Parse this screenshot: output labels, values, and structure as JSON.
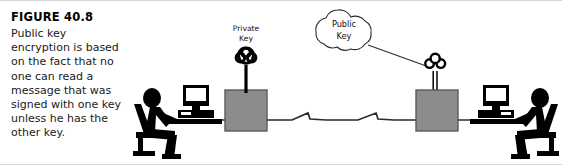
{
  "figure": {
    "title": "FIGURE 40.8",
    "caption": "Public key encryption is based on the fact that no one can read a message that was signed with one key unless he has the other key.",
    "caption_lines": [
      "Public key encryption is",
      "based on the fact that",
      "no one can read a",
      "message that was",
      "signed with one key",
      "unless he has the other",
      "key."
    ]
  },
  "diagram": {
    "type": "public-key-encryption-network-diagram",
    "labels": {
      "private_key_line1": "Private",
      "private_key_line2": "Key",
      "public_key_line1": "Public",
      "public_key_line2": "Key"
    },
    "nodes": [
      {
        "name": "left-user",
        "kind": "person-at-computer",
        "facing": "right"
      },
      {
        "name": "left-computer",
        "kind": "desktop-computer"
      },
      {
        "name": "left-server-box",
        "kind": "gray-box"
      },
      {
        "name": "left-private-key",
        "kind": "key-icon",
        "style": "solid"
      },
      {
        "name": "public-key-cloud",
        "kind": "cloud"
      },
      {
        "name": "right-public-key",
        "kind": "key-icon",
        "style": "outline"
      },
      {
        "name": "right-server-box",
        "kind": "gray-box"
      },
      {
        "name": "right-computer",
        "kind": "desktop-computer"
      },
      {
        "name": "right-user",
        "kind": "person-at-computer",
        "facing": "left"
      }
    ],
    "links": [
      {
        "from": "left-computer",
        "to": "left-server-box",
        "style": "straight"
      },
      {
        "from": "left-server-box",
        "to": "right-server-box",
        "style": "zigzag-wan"
      },
      {
        "from": "left-private-key",
        "to": "left-server-box",
        "style": "stem"
      },
      {
        "from": "public-key-cloud",
        "to": "right-public-key",
        "style": "straight"
      },
      {
        "from": "right-public-key",
        "to": "right-server-box",
        "style": "stem"
      },
      {
        "from": "right-server-box",
        "to": "right-computer",
        "style": "straight"
      }
    ],
    "colors": {
      "box_fill": "#8c8c8c",
      "box_stroke": "#5a5a5a",
      "ink": "#000000",
      "line": "#3a3a3a",
      "background": "#ffffff"
    }
  }
}
